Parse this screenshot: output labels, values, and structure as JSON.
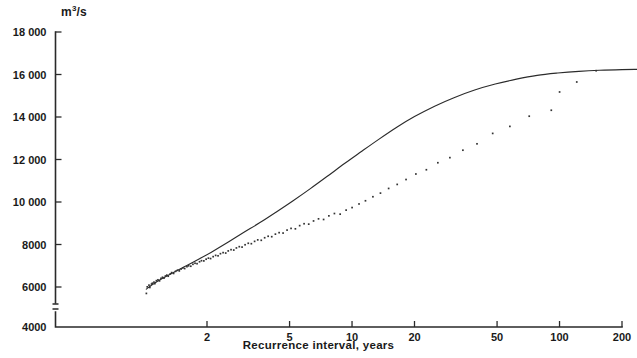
{
  "chart_data": {
    "type": "scatter",
    "title": "",
    "subtitle": "",
    "xlabel": "Recurrence interval, years",
    "ylabel": "m3/s",
    "ylabel_display": "m",
    "ylabel_exponent": "3",
    "ylabel_suffix": "/s",
    "xscale": "log",
    "yscale": "linear",
    "xlim": [
      1.0,
      260
    ],
    "ylim": [
      4000,
      18000
    ],
    "grid": false,
    "legend": null,
    "axis_break": {
      "present": true,
      "between": [
        4000,
        5500
      ],
      "axis": "y"
    },
    "xticks": [
      2,
      5,
      10,
      20,
      50,
      100,
      200
    ],
    "xtick_labels": [
      "2",
      "5",
      "10",
      "20",
      "50",
      "100",
      "200"
    ],
    "yticks": [
      4000,
      6000,
      8000,
      10000,
      12000,
      14000,
      16000,
      18000
    ],
    "ytick_labels": [
      "4000",
      "6000",
      "8000",
      "10 000",
      "12 000",
      "14 000",
      "16 000",
      "18 000"
    ],
    "series": [
      {
        "name": "fitted frequency curve",
        "type": "line",
        "x": [
          1.02,
          1.08,
          1.15,
          1.25,
          1.4,
          1.6,
          1.85,
          2.1,
          2.5,
          3.0,
          3.6,
          4.3,
          5.2,
          6.3,
          7.6,
          9.2,
          11.0,
          13.5,
          16.5,
          20.0,
          25.0,
          31.0,
          39.0,
          49.0,
          62.0,
          78.0,
          98.0,
          124.0,
          156.0,
          200.0,
          240.0
        ],
        "y": [
          5900,
          6080,
          6260,
          6460,
          6720,
          7010,
          7340,
          7640,
          8080,
          8560,
          9030,
          9520,
          10060,
          10630,
          11210,
          11810,
          12350,
          12960,
          13530,
          14020,
          14510,
          14910,
          15270,
          15550,
          15780,
          15960,
          16070,
          16150,
          16200,
          16230,
          16240
        ]
      },
      {
        "name": "annual maximum discharge observations",
        "type": "scatter",
        "x": [
          1.02,
          1.03,
          1.05,
          1.06,
          1.08,
          1.09,
          1.11,
          1.12,
          1.14,
          1.16,
          1.18,
          1.2,
          1.22,
          1.24,
          1.26,
          1.28,
          1.3,
          1.33,
          1.35,
          1.38,
          1.41,
          1.44,
          1.47,
          1.5,
          1.53,
          1.56,
          1.6,
          1.63,
          1.67,
          1.71,
          1.75,
          1.79,
          1.84,
          1.88,
          1.93,
          1.98,
          2.03,
          2.08,
          2.14,
          2.2,
          2.26,
          2.32,
          2.39,
          2.46,
          2.53,
          2.61,
          2.69,
          2.77,
          2.86,
          2.95,
          3.05,
          3.16,
          3.27,
          3.39,
          3.51,
          3.65,
          3.79,
          3.94,
          4.1,
          4.27,
          4.45,
          4.65,
          4.86,
          5.08,
          5.33,
          5.59,
          5.87,
          6.18,
          6.52,
          6.89,
          7.29,
          7.73,
          8.22,
          8.76,
          9.36,
          10.0,
          10.8,
          11.6,
          12.6,
          13.7,
          15.0,
          16.5,
          18.2,
          20.3,
          22.8,
          25.9,
          29.6,
          34.2,
          40.0,
          47.6,
          57.6,
          71.4,
          91.2,
          100.0,
          121.0,
          150.0
        ],
        "y": [
          5700,
          6010,
          6090,
          5980,
          6140,
          6180,
          6230,
          6160,
          6300,
          6340,
          6290,
          6410,
          6460,
          6420,
          6520,
          6560,
          6510,
          6620,
          6680,
          6640,
          6740,
          6790,
          6760,
          6850,
          6900,
          6870,
          6960,
          7000,
          6980,
          7070,
          7120,
          7100,
          7190,
          7240,
          7230,
          7310,
          7360,
          7340,
          7430,
          7490,
          7470,
          7570,
          7620,
          7600,
          7700,
          7760,
          7740,
          7840,
          7900,
          7880,
          7990,
          8060,
          8040,
          8150,
          8220,
          8200,
          8320,
          8390,
          8370,
          8490,
          8560,
          8540,
          8680,
          8760,
          8740,
          8890,
          8980,
          8960,
          9110,
          9210,
          9180,
          9350,
          9460,
          9430,
          9620,
          9740,
          9910,
          10060,
          10250,
          10420,
          10640,
          10830,
          11060,
          11320,
          11520,
          11850,
          12090,
          12440,
          12740,
          13230,
          13560,
          14040,
          14320,
          15180,
          15650,
          16180
        ]
      }
    ],
    "annotations": [
      {
        "text": "low outlier near left axis",
        "x": 1.02,
        "y": 5700
      },
      {
        "text": "low outlier below curve",
        "x": 100.0,
        "y": 15180
      }
    ],
    "colors": {
      "curve": "#2b2b2b",
      "points": "#333333",
      "axis": "#2a2a2a",
      "background": "#ffffff"
    }
  },
  "figure": {
    "unit_label_prefix": "m",
    "unit_label_exponent": "3",
    "unit_label_suffix": "/s",
    "x_axis_title": "Recurrence interval, years"
  }
}
